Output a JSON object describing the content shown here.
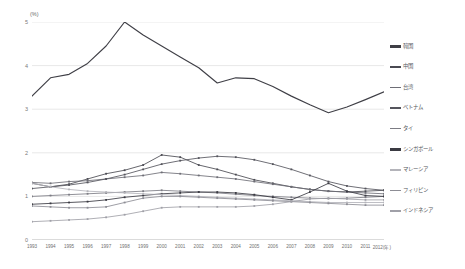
{
  "chart": {
    "unit_label": "(%)",
    "y_ticks": [
      "5",
      "4",
      "3",
      "2",
      "1",
      "0"
    ],
    "x_tick_labels": [
      "1993",
      "1994",
      "1995",
      "1996",
      "1997",
      "1998",
      "1999",
      "2000",
      "2001",
      "2002",
      "2003",
      "2004",
      "2005",
      "2006",
      "2007",
      "2008",
      "2009",
      "2010",
      "2011",
      "2012(年)"
    ]
  },
  "legend": {
    "items": [
      {
        "label": "韓国",
        "color": "#3f3f46",
        "thick": true
      },
      {
        "label": "中国",
        "color": "#4a4a52",
        "thick": true
      },
      {
        "label": "台湾",
        "color": "#6e6e76",
        "thick": false
      },
      {
        "label": "ベトナム",
        "color": "#55555d",
        "thick": true
      },
      {
        "label": "タイ",
        "color": "#7c7c84",
        "thick": false
      },
      {
        "label": "シンガポール",
        "color": "#3a3a42",
        "thick": true
      },
      {
        "label": "マレーシア",
        "color": "#b4b4ba",
        "thick": false
      },
      {
        "label": "フィリピン",
        "color": "#8d8d95",
        "thick": false
      },
      {
        "label": "インドネシア",
        "color": "#a0a0a8",
        "thick": false
      }
    ]
  },
  "chart_data": {
    "type": "line",
    "title": "",
    "xlabel": "年",
    "ylabel": "(%)",
    "ylim": [
      0,
      5
    ],
    "xlim": [
      1993,
      2012
    ],
    "grid": true,
    "legend_position": "right",
    "x": [
      1993,
      1994,
      1995,
      1996,
      1997,
      1998,
      1999,
      2000,
      2001,
      2002,
      2003,
      2004,
      2005,
      2006,
      2007,
      2008,
      2009,
      2010,
      2011,
      2012
    ],
    "series": [
      {
        "name": "韓国",
        "color": "#3f3f46",
        "values": [
          3.3,
          3.72,
          3.8,
          4.05,
          4.45,
          5.0,
          4.7,
          4.45,
          4.2,
          3.95,
          3.6,
          3.72,
          3.7,
          3.52,
          3.3,
          3.1,
          2.92,
          3.05,
          3.22,
          3.4
        ]
      },
      {
        "name": "中国",
        "color": "#4a4a52",
        "values": [
          1.3,
          1.22,
          1.28,
          1.4,
          1.52,
          1.6,
          1.72,
          1.95,
          1.9,
          1.72,
          1.62,
          1.5,
          1.38,
          1.3,
          1.22,
          1.16,
          1.12,
          1.1,
          1.12,
          1.14
        ]
      },
      {
        "name": "台湾",
        "color": "#6e6e76",
        "values": [
          1.32,
          1.3,
          1.34,
          1.36,
          1.4,
          1.44,
          1.48,
          1.55,
          1.52,
          1.48,
          1.44,
          1.4,
          1.34,
          1.28,
          1.22,
          1.16,
          1.12,
          1.1,
          1.08,
          1.06
        ]
      },
      {
        "name": "ベトナム",
        "color": "#55555d",
        "values": [
          1.18,
          1.22,
          1.26,
          1.32,
          1.4,
          1.5,
          1.62,
          1.74,
          1.82,
          1.88,
          1.92,
          1.9,
          1.84,
          1.74,
          1.62,
          1.48,
          1.34,
          1.24,
          1.18,
          1.14
        ]
      },
      {
        "name": "タイ",
        "color": "#7c7c84",
        "values": [
          1.0,
          1.02,
          1.04,
          1.06,
          1.08,
          1.1,
          1.12,
          1.14,
          1.12,
          1.1,
          1.08,
          1.05,
          1.02,
          1.0,
          0.98,
          0.96,
          0.95,
          0.96,
          0.98,
          1.0
        ]
      },
      {
        "name": "シンガポール",
        "color": "#3a3a42",
        "values": [
          0.82,
          0.84,
          0.86,
          0.88,
          0.92,
          0.98,
          1.02,
          1.06,
          1.08,
          1.1,
          1.1,
          1.08,
          1.04,
          0.98,
          0.92,
          1.1,
          1.3,
          1.12,
          1.02,
          1.0
        ]
      },
      {
        "name": "マレーシア",
        "color": "#b4b4ba",
        "values": [
          1.3,
          1.22,
          1.16,
          1.12,
          1.1,
          1.08,
          1.06,
          1.04,
          1.02,
          1.0,
          0.98,
          0.96,
          0.94,
          0.92,
          0.9,
          0.88,
          0.86,
          0.86,
          0.86,
          0.86
        ]
      },
      {
        "name": "フィリピン",
        "color": "#8d8d95",
        "values": [
          0.78,
          0.76,
          0.74,
          0.74,
          0.76,
          0.86,
          0.96,
          1.0,
          1.0,
          0.98,
          0.96,
          0.94,
          0.92,
          0.9,
          0.88,
          0.86,
          0.84,
          0.82,
          0.8,
          0.8
        ]
      },
      {
        "name": "インドネシア",
        "color": "#a0a0a8",
        "values": [
          0.42,
          0.44,
          0.46,
          0.48,
          0.52,
          0.58,
          0.66,
          0.74,
          0.76,
          0.76,
          0.76,
          0.76,
          0.78,
          0.82,
          0.88,
          0.94,
          0.96,
          0.94,
          0.92,
          0.92
        ]
      }
    ]
  }
}
